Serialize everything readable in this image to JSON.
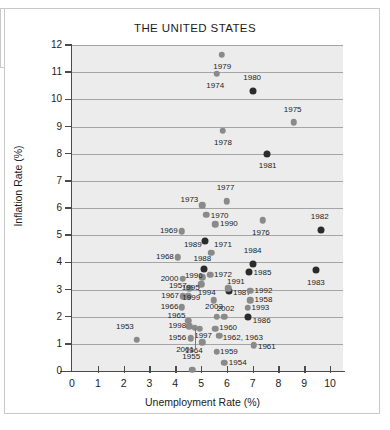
{
  "chart_data": {
    "type": "scatter",
    "title": "THE UNITED STATES",
    "xlabel": "Unemployment Rate (%)",
    "ylabel": "Inflation Rate (%)",
    "xlim": [
      0,
      10.5
    ],
    "ylim": [
      0,
      12
    ],
    "xticks": [
      0,
      1,
      2,
      3,
      4,
      5,
      6,
      7,
      8,
      9,
      10
    ],
    "yticks": [
      0,
      1,
      2,
      3,
      4,
      5,
      6,
      7,
      8,
      9,
      10,
      11,
      12
    ],
    "grid": "horizontal",
    "legend": "none",
    "series": [
      {
        "name": "Year observations",
        "points": [
          {
            "label": "1953",
            "x": 2.5,
            "y": 1.15,
            "shade": "light",
            "lx": 2.05,
            "ly": 1.62
          },
          {
            "label": "1954",
            "x": 5.9,
            "y": 0.3,
            "shade": "light",
            "lx": 6.42,
            "ly": 0.3
          },
          {
            "label": "1955",
            "x": 4.65,
            "y": 0.05,
            "shade": "light",
            "lx": 4.62,
            "ly": 0.52
          },
          {
            "label": "1956",
            "x": 4.6,
            "y": 1.2,
            "shade": "light",
            "lx": 4.08,
            "ly": 1.2
          },
          {
            "label": "1957",
            "x": 4.55,
            "y": 3.05,
            "shade": "light",
            "lx": 4.1,
            "ly": 3.12
          },
          {
            "label": "1958",
            "x": 6.9,
            "y": 2.6,
            "shade": "light",
            "lx": 7.42,
            "ly": 2.6
          },
          {
            "label": "1959",
            "x": 5.6,
            "y": 0.7,
            "shade": "light",
            "lx": 6.08,
            "ly": 0.7
          },
          {
            "label": "1960",
            "x": 5.55,
            "y": 1.55,
            "shade": "light",
            "lx": 6.05,
            "ly": 1.58
          },
          {
            "label": "1961",
            "x": 7.05,
            "y": 0.95,
            "shade": "light",
            "lx": 7.55,
            "ly": 0.88
          },
          {
            "label": "1962, 1963",
            "x": 5.7,
            "y": 1.3,
            "shade": "light",
            "lx": 6.62,
            "ly": 1.22
          },
          {
            "label": "1964",
            "x": 5.05,
            "y": 1.05,
            "shade": "light",
            "lx": 4.72,
            "ly": 0.72
          },
          {
            "label": "1965",
            "x": 4.5,
            "y": 1.85,
            "shade": "light",
            "lx": 4.05,
            "ly": 2.02
          },
          {
            "label": "1966",
            "x": 4.25,
            "y": 2.35,
            "shade": "light",
            "lx": 3.78,
            "ly": 2.35
          },
          {
            "label": "1967",
            "x": 4.3,
            "y": 2.75,
            "shade": "light",
            "lx": 3.8,
            "ly": 2.75
          },
          {
            "label": "1968",
            "x": 4.1,
            "y": 4.18,
            "shade": "light",
            "lx": 3.6,
            "ly": 4.18
          },
          {
            "label": "1969",
            "x": 4.25,
            "y": 5.15,
            "shade": "light",
            "lx": 3.75,
            "ly": 5.15
          },
          {
            "label": "1970",
            "x": 5.2,
            "y": 5.75,
            "shade": "light",
            "lx": 5.72,
            "ly": 5.7
          },
          {
            "label": "1971",
            "x": 5.4,
            "y": 4.35,
            "shade": "light",
            "lx": 5.85,
            "ly": 4.62
          },
          {
            "label": "1972",
            "x": 5.35,
            "y": 3.55,
            "shade": "light",
            "lx": 5.85,
            "ly": 3.55
          },
          {
            "label": "1973",
            "x": 5.05,
            "y": 6.1,
            "shade": "light",
            "lx": 4.55,
            "ly": 6.3
          },
          {
            "label": "1974",
            "x": 5.6,
            "y": 10.95,
            "shade": "light",
            "lx": 5.55,
            "ly": 10.5
          },
          {
            "label": "1975",
            "x": 8.6,
            "y": 9.15,
            "shade": "light",
            "lx": 8.55,
            "ly": 9.62
          },
          {
            "label": "1976",
            "x": 7.4,
            "y": 5.55,
            "shade": "light",
            "lx": 7.32,
            "ly": 5.08
          },
          {
            "label": "1977",
            "x": 6.0,
            "y": 6.25,
            "shade": "light",
            "lx": 5.95,
            "ly": 6.72
          },
          {
            "label": "1978",
            "x": 5.85,
            "y": 8.85,
            "shade": "light",
            "lx": 5.85,
            "ly": 8.38
          },
          {
            "label": "1979",
            "x": 5.8,
            "y": 11.65,
            "shade": "light",
            "lx": 5.82,
            "ly": 11.18
          },
          {
            "label": "1980",
            "x": 7.0,
            "y": 10.3,
            "shade": "dark",
            "lx": 6.98,
            "ly": 10.78
          },
          {
            "label": "1981",
            "x": 7.55,
            "y": 8.0,
            "shade": "dark",
            "lx": 7.58,
            "ly": 7.55
          },
          {
            "label": "1982",
            "x": 9.65,
            "y": 5.2,
            "shade": "dark",
            "lx": 9.6,
            "ly": 5.68
          },
          {
            "label": "1983",
            "x": 9.45,
            "y": 3.7,
            "shade": "dark",
            "lx": 9.45,
            "ly": 3.25
          },
          {
            "label": "1984",
            "x": 7.0,
            "y": 3.95,
            "shade": "dark",
            "lx": 7.0,
            "ly": 4.42
          },
          {
            "label": "1985",
            "x": 6.85,
            "y": 3.65,
            "shade": "dark",
            "lx": 7.38,
            "ly": 3.62
          },
          {
            "label": "1986",
            "x": 6.8,
            "y": 2.0,
            "shade": "dark",
            "lx": 7.35,
            "ly": 1.85
          },
          {
            "label": "1987",
            "x": 6.1,
            "y": 2.95,
            "shade": "dark",
            "lx": 6.58,
            "ly": 2.88
          },
          {
            "label": "1988",
            "x": 5.1,
            "y": 3.75,
            "shade": "dark",
            "lx": 5.05,
            "ly": 4.12
          },
          {
            "label": "1989",
            "x": 5.15,
            "y": 4.8,
            "shade": "dark",
            "lx": 4.68,
            "ly": 4.62
          },
          {
            "label": "1990",
            "x": 5.55,
            "y": 5.4,
            "shade": "light",
            "lx": 6.08,
            "ly": 5.4
          },
          {
            "label": "1991",
            "x": 6.05,
            "y": 3.05,
            "shade": "light",
            "lx": 6.35,
            "ly": 3.28
          },
          {
            "label": "1992",
            "x": 6.9,
            "y": 2.95,
            "shade": "light",
            "lx": 7.42,
            "ly": 2.95
          },
          {
            "label": "1993",
            "x": 6.8,
            "y": 2.32,
            "shade": "light",
            "lx": 7.3,
            "ly": 2.32
          },
          {
            "label": "1994",
            "x": 5.5,
            "y": 2.6,
            "shade": "light",
            "lx": 5.22,
            "ly": 2.88
          },
          {
            "label": "1995",
            "x": 5.0,
            "y": 3.2,
            "shade": "light",
            "lx": 4.6,
            "ly": 3.05
          },
          {
            "label": "1996",
            "x": 5.05,
            "y": 3.45,
            "shade": "light",
            "lx": 4.72,
            "ly": 3.48
          },
          {
            "label": "1997",
            "x": 4.95,
            "y": 1.55,
            "shade": "light",
            "lx": 5.08,
            "ly": 1.28
          },
          {
            "label": "1998",
            "x": 4.55,
            "y": 1.65,
            "shade": "light",
            "lx": 4.08,
            "ly": 1.65
          },
          {
            "label": "1999",
            "x": 4.5,
            "y": 2.75,
            "shade": "light",
            "lx": 4.62,
            "ly": 2.68
          },
          {
            "label": "2000",
            "x": 4.3,
            "y": 3.4,
            "shade": "light",
            "lx": 3.78,
            "ly": 3.4
          },
          {
            "label": "2001",
            "x": 4.75,
            "y": 1.6,
            "shade": "light",
            "lx": 4.38,
            "ly": 0.78
          },
          {
            "label": "2002",
            "x": 5.9,
            "y": 2.0,
            "shade": "light",
            "lx": 5.95,
            "ly": 2.28
          },
          {
            "label": "2003",
            "x": 5.6,
            "y": 2.0,
            "shade": "light",
            "lx": 5.5,
            "ly": 2.35
          }
        ]
      }
    ]
  },
  "page": {
    "title": "THE UNITED STATES"
  }
}
